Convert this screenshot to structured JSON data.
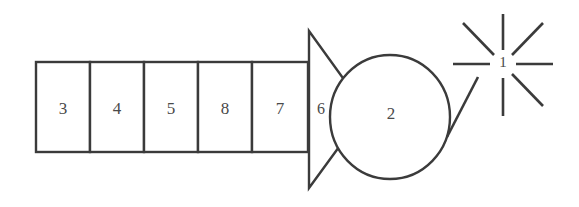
{
  "diagram": {
    "background_color": "#ffffff",
    "stroke_color": "#3b3b3b",
    "text_color": "#4a4a4a",
    "boxes": [
      {
        "label": "3"
      },
      {
        "label": "4"
      },
      {
        "label": "5"
      },
      {
        "label": "8"
      },
      {
        "label": "7"
      }
    ],
    "triangle": {
      "label": "6"
    },
    "circle": {
      "label": "2"
    },
    "starburst": {
      "label": "1",
      "ray_count": 8
    }
  }
}
